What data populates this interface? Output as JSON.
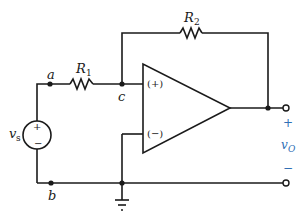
{
  "diagram": {
    "type": "non-inverting op-amp circuit",
    "components": {
      "source": {
        "label": "v",
        "sub": "s",
        "plus": "+",
        "minus": "−"
      },
      "r1": {
        "label": "R",
        "sub": "1"
      },
      "r2": {
        "label": "R",
        "sub": "2"
      },
      "opamp": {
        "plus_input": "(+)",
        "minus_input": "(−)"
      }
    },
    "nodes": {
      "a": "a",
      "b": "b",
      "c": "c"
    },
    "output": {
      "label": "v",
      "sub": "O",
      "plus": "+",
      "minus": "−"
    },
    "colors": {
      "wire": "#1a1a1a",
      "output_label": "#2f6fb5"
    }
  }
}
